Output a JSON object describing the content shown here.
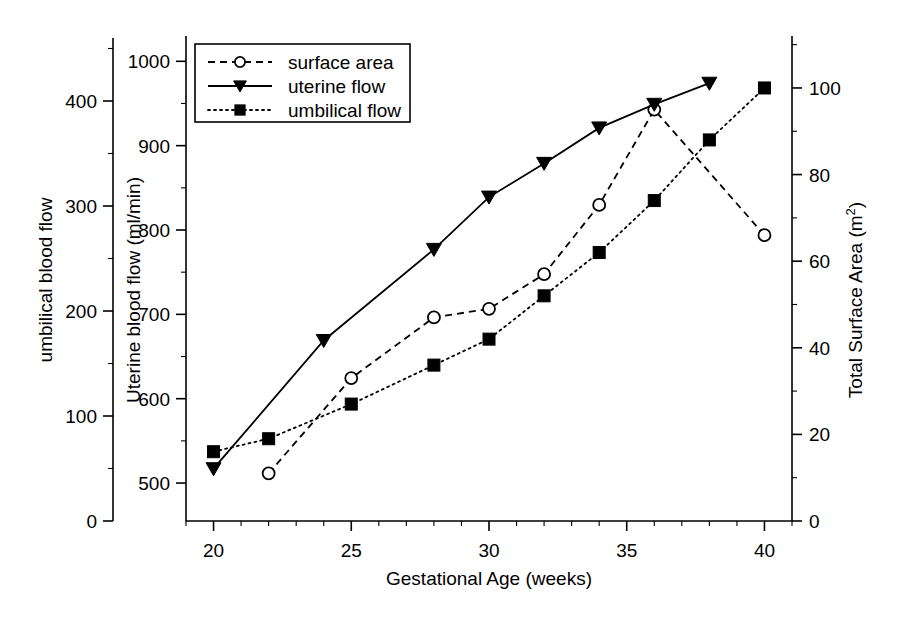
{
  "chart_data": {
    "type": "line",
    "title": "",
    "xlabel": "Gestational Age (weeks)",
    "ylabel": "Uterine blood flow (ml/min)",
    "ylabel_left_outer": "umbilical blood flow",
    "ylabel_right": "Total Surface Area (m2)",
    "ylabel_right_display": "Total Surface Area (m",
    "ylabel_right_sup": "2",
    "ylabel_right_close": ")",
    "grid": false,
    "legend_position": "top-left",
    "x": [
      20,
      22,
      24,
      25,
      28,
      30,
      32,
      34,
      36,
      38,
      40
    ],
    "xlim": [
      19,
      41
    ],
    "xticks": [
      20,
      25,
      30,
      35,
      40
    ],
    "xticklabels": [
      "20",
      "25",
      "30",
      "35",
      "40"
    ],
    "axis_uterine": {
      "label": "Uterine blood flow (ml/min)",
      "ticks": [
        500,
        600,
        700,
        800,
        900,
        1000
      ],
      "ticklabels": [
        "500",
        "600",
        "700",
        "800",
        "900",
        "1000"
      ],
      "lim": [
        455,
        1030
      ],
      "minor_interval": 50
    },
    "axis_umbilical": {
      "label": "umbilical blood flow",
      "ticks": [
        0,
        100,
        200,
        300,
        400
      ],
      "ticklabels": [
        "0",
        "100",
        "200",
        "300",
        "400"
      ],
      "lim": [
        0,
        460
      ],
      "minor_interval": 50
    },
    "axis_surface_area": {
      "label": "Total Surface Area (m2)",
      "ticks": [
        0,
        20,
        40,
        60,
        80,
        100
      ],
      "ticklabels": [
        "0",
        "20",
        "40",
        "60",
        "80",
        "100"
      ],
      "lim": [
        0,
        112
      ],
      "minor_interval": 10
    },
    "series": [
      {
        "name": "surface area",
        "marker": "open-circle",
        "linestyle": "dashed",
        "axis": "right",
        "units": "m2",
        "x": [
          22,
          25,
          28,
          30,
          32,
          34,
          36,
          40
        ],
        "values": [
          11,
          33,
          47,
          49,
          57,
          73,
          95,
          66
        ]
      },
      {
        "name": "uterine flow",
        "marker": "filled-triangle-down",
        "linestyle": "solid",
        "axis": "left-inner",
        "units": "ml/min",
        "x": [
          20,
          24,
          28,
          30,
          32,
          34,
          36,
          38
        ],
        "values": [
          517,
          669,
          777,
          839,
          879,
          921,
          949,
          974
        ]
      },
      {
        "name": "umbilical flow",
        "marker": "filled-square",
        "linestyle": "dotted",
        "axis": "right",
        "units": "m2 scale",
        "x": [
          20,
          22,
          25,
          28,
          30,
          32,
          34,
          36,
          38,
          40
        ],
        "values": [
          16,
          19,
          27,
          36,
          42,
          52,
          62,
          74,
          88,
          100
        ]
      }
    ],
    "legend_entries": [
      {
        "label": "surface area",
        "marker": "open-circle",
        "linestyle": "dashed"
      },
      {
        "label": "uterine flow",
        "marker": "filled-triangle-down",
        "linestyle": "solid"
      },
      {
        "label": "umbilical flow",
        "marker": "filled-square",
        "linestyle": "dotted"
      }
    ],
    "colors": {
      "foreground": "#000000",
      "background": "#ffffff"
    }
  }
}
